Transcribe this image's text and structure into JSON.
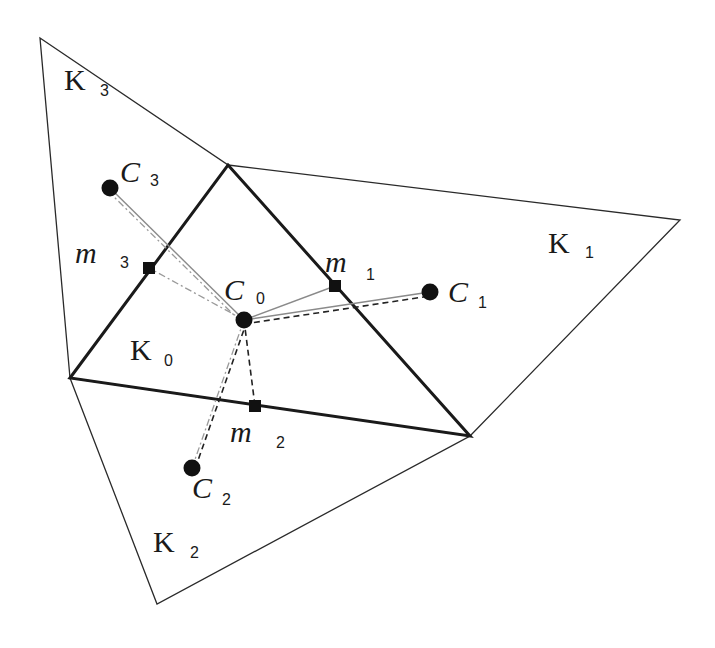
{
  "diagram": {
    "type": "finite-volume mesh diagram",
    "vertices": {
      "A": [
        40,
        38
      ],
      "B": [
        228,
        165
      ],
      "C": [
        680,
        220
      ],
      "D": [
        470,
        436
      ],
      "E": [
        70,
        378
      ],
      "F": [
        157,
        604
      ]
    },
    "cells": [
      {
        "id": "K0",
        "label": "K",
        "sub": "0",
        "label_pos": [
          130,
          360
        ],
        "sub_pos": [
          164,
          366
        ],
        "polygon": [
          "B",
          "D",
          "E"
        ],
        "thick": true
      },
      {
        "id": "K1",
        "label": "K",
        "sub": "1",
        "label_pos": [
          548,
          253
        ],
        "sub_pos": [
          585,
          258
        ],
        "polygon": [
          "B",
          "C",
          "D"
        ],
        "thick": false
      },
      {
        "id": "K2",
        "label": "K",
        "sub": "2",
        "label_pos": [
          153,
          552
        ],
        "sub_pos": [
          190,
          558
        ],
        "polygon": [
          "E",
          "D",
          "F"
        ],
        "thick": false
      },
      {
        "id": "K3",
        "label": "K",
        "sub": "3",
        "label_pos": [
          64,
          90
        ],
        "sub_pos": [
          100,
          96
        ],
        "polygon": [
          "A",
          "B",
          "E"
        ],
        "thick": false
      }
    ],
    "centroids": [
      {
        "id": "C0",
        "label": "C",
        "sub": "0",
        "pos": [
          244,
          320
        ],
        "label_pos": [
          224,
          300
        ],
        "sub_pos": [
          256,
          304
        ]
      },
      {
        "id": "C1",
        "label": "C",
        "sub": "1",
        "pos": [
          430,
          292
        ],
        "label_pos": [
          448,
          302
        ],
        "sub_pos": [
          478,
          308
        ]
      },
      {
        "id": "C2",
        "label": "C",
        "sub": "2",
        "pos": [
          192,
          468
        ],
        "label_pos": [
          192,
          498
        ],
        "sub_pos": [
          222,
          505
        ]
      },
      {
        "id": "C3",
        "label": "C",
        "sub": "3",
        "pos": [
          110,
          188
        ],
        "label_pos": [
          120,
          182
        ],
        "sub_pos": [
          150,
          186
        ]
      }
    ],
    "midpoints": [
      {
        "id": "m1",
        "label": "m",
        "sub": "1",
        "pos": [
          335,
          286
        ],
        "label_pos": [
          325,
          272
        ],
        "sub_pos": [
          366,
          280
        ]
      },
      {
        "id": "m2",
        "label": "m",
        "sub": "2",
        "pos": [
          255,
          406
        ],
        "label_pos": [
          230,
          442
        ],
        "sub_pos": [
          276,
          448
        ]
      },
      {
        "id": "m3",
        "label": "m",
        "sub": "3",
        "pos": [
          149,
          268
        ],
        "label_pos": [
          75,
          263
        ],
        "sub_pos": [
          120,
          268
        ]
      }
    ],
    "connections": [
      {
        "from": "C0",
        "to": "C1",
        "style": "solid-gray"
      },
      {
        "from": "C0",
        "to": "C1",
        "style": "dashed-dark",
        "offset": [
          0,
          4
        ]
      },
      {
        "from": "C0",
        "to": "m1",
        "style": "solid-gray"
      },
      {
        "from": "C0",
        "to": "C3",
        "style": "solid-gray"
      },
      {
        "from": "C0",
        "to": "C3",
        "style": "dashdot-gray",
        "offset": [
          -3,
          2
        ]
      },
      {
        "from": "C0",
        "to": "m3",
        "style": "dashdot-gray"
      },
      {
        "from": "C0",
        "to": "C2",
        "style": "dashdot-gray"
      },
      {
        "from": "C0",
        "to": "C2",
        "style": "dashed-dark",
        "offset": [
          3,
          1
        ]
      },
      {
        "from": "C0",
        "to": "m2",
        "style": "dashed-dark"
      }
    ],
    "colors": {
      "background": "#ffffff",
      "stroke": "#1a1a1a",
      "thin_stroke": "#2a2a2a",
      "gray_line": "#8a8a8a",
      "marker": "#111111"
    }
  }
}
